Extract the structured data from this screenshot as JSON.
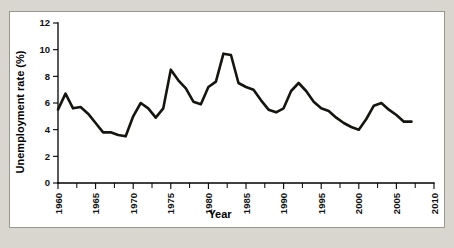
{
  "figure": {
    "background_color": "#d9d6cf",
    "card_color": "#ffffff",
    "border_color": "#9a978f",
    "line_color": "#16140f"
  },
  "chart_data": {
    "type": "line",
    "title": "",
    "xlabel": "Year",
    "ylabel": "Unemployment rate (%)",
    "xlim": [
      1960,
      2010
    ],
    "ylim": [
      0,
      12
    ],
    "grid": false,
    "legend": "none",
    "x_ticks": [
      1960,
      1965,
      1970,
      1975,
      1980,
      1985,
      1990,
      1995,
      2000,
      2005,
      2010
    ],
    "x_tick_labels": [
      "1960",
      "1965",
      "1970",
      "1975",
      "1980",
      "1985",
      "1990",
      "1995",
      "2000",
      "2005",
      "2010"
    ],
    "x_minor_tick_interval": 2.5,
    "y_ticks": [
      0,
      2,
      4,
      6,
      8,
      10,
      12
    ],
    "y_tick_labels": [
      "0",
      "2",
      "4",
      "6",
      "8",
      "10",
      "12"
    ],
    "series": [
      {
        "name": "Unemployment rate",
        "color": "#16140f",
        "x": [
          1960,
          1961,
          1962,
          1963,
          1964,
          1965,
          1966,
          1967,
          1968,
          1969,
          1970,
          1971,
          1972,
          1973,
          1974,
          1975,
          1976,
          1977,
          1978,
          1979,
          1980,
          1981,
          1982,
          1983,
          1984,
          1985,
          1986,
          1987,
          1988,
          1989,
          1990,
          1991,
          1992,
          1993,
          1994,
          1995,
          1996,
          1997,
          1998,
          1999,
          2000,
          2001,
          2002,
          2003,
          2004,
          2005,
          2006,
          2007
        ],
        "values": [
          5.5,
          6.7,
          5.6,
          5.7,
          5.2,
          4.5,
          3.8,
          3.8,
          3.6,
          3.5,
          5.0,
          6.0,
          5.6,
          4.9,
          5.6,
          8.5,
          7.7,
          7.1,
          6.1,
          5.9,
          7.2,
          7.6,
          9.7,
          9.6,
          7.5,
          7.2,
          7.0,
          6.2,
          5.5,
          5.3,
          5.6,
          6.9,
          7.5,
          6.9,
          6.1,
          5.6,
          5.4,
          4.9,
          4.5,
          4.2,
          4.0,
          4.8,
          5.8,
          6.0,
          5.5,
          5.1,
          4.6,
          4.6
        ]
      }
    ]
  }
}
